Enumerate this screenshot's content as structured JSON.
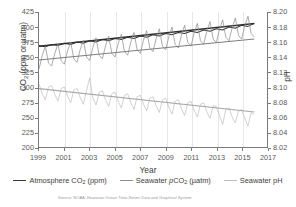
{
  "chart_data": {
    "type": "line",
    "title": "",
    "xlabel": "Year",
    "ylabel": "CO2 (ppm or µatm)",
    "ylabel_right": "pH",
    "xlim": [
      1999,
      2017
    ],
    "ylim": [
      200,
      425
    ],
    "ylim_right": [
      8.02,
      8.2
    ],
    "grid": "vertical-only",
    "legend_position": "bottom-center",
    "source": "Source: NOAA, Hawaiian Ocean Time-Series Data and Graphical System",
    "xticks": [
      "1999",
      "2001",
      "2003",
      "2005",
      "2007",
      "2009",
      "2011",
      "2013",
      "2015",
      "2017"
    ],
    "yticks_left": [
      "200",
      "225",
      "250",
      "275",
      "300",
      "325",
      "350",
      "375",
      "400",
      "425"
    ],
    "yticks_right": [
      "8.02",
      "8.04",
      "8.06",
      "8.08",
      "8.10",
      "8.12",
      "8.14",
      "8.16",
      "8.18",
      "8.20"
    ],
    "colors": {
      "atmosphere": "#3a3a3a",
      "seawater_pco2": "#8f8f8f",
      "seawater_ph": "#bdbdbd",
      "axis": "#7a7a7a",
      "gridline": "#e6e6e6"
    },
    "series": [
      {
        "name": "Atmosphere CO2 (ppm)",
        "axis": "left",
        "units": "ppm",
        "color": "#3a3a3a",
        "trend_start": 368,
        "trend_end": 406,
        "seasonal_amplitude": 3,
        "x": [
          1999.0,
          1999.5,
          2000.0,
          2000.5,
          2001.0,
          2001.5,
          2002.0,
          2002.5,
          2003.0,
          2003.5,
          2004.0,
          2004.5,
          2005.0,
          2005.5,
          2006.0,
          2006.5,
          2007.0,
          2007.5,
          2008.0,
          2008.5,
          2009.0,
          2009.5,
          2010.0,
          2010.5,
          2011.0,
          2011.5,
          2012.0,
          2012.5,
          2013.0,
          2013.5,
          2014.0,
          2014.5,
          2015.0,
          2015.5,
          2016.0
        ],
        "values": [
          369,
          367,
          371,
          369,
          373,
          371,
          375,
          373,
          377,
          375,
          379,
          377,
          381,
          379,
          383,
          381,
          385,
          383,
          387,
          385,
          389,
          387,
          391,
          389,
          393,
          391,
          395,
          393,
          397,
          395,
          400,
          398,
          403,
          401,
          406
        ]
      },
      {
        "name": "Seawater pCO2 (µatm)",
        "axis": "left",
        "units": "µatm",
        "color": "#8f8f8f",
        "trend_start": 345,
        "trend_end": 380,
        "seasonal_amplitude": 22,
        "x": [
          1999.0,
          1999.25,
          1999.5,
          1999.75,
          2000.0,
          2000.25,
          2000.5,
          2000.75,
          2001.0,
          2001.25,
          2001.5,
          2001.75,
          2002.0,
          2002.25,
          2002.5,
          2002.75,
          2003.0,
          2003.25,
          2003.5,
          2003.75,
          2004.0,
          2004.25,
          2004.5,
          2004.75,
          2005.0,
          2005.25,
          2005.5,
          2005.75,
          2006.0,
          2006.25,
          2006.5,
          2006.75,
          2007.0,
          2007.25,
          2007.5,
          2007.75,
          2008.0,
          2008.25,
          2008.5,
          2008.75,
          2009.0,
          2009.25,
          2009.5,
          2009.75,
          2010.0,
          2010.25,
          2010.5,
          2010.75,
          2011.0,
          2011.25,
          2011.5,
          2011.75,
          2012.0,
          2012.25,
          2012.5,
          2012.75,
          2013.0,
          2013.25,
          2013.5,
          2013.75,
          2014.0,
          2014.25,
          2014.5,
          2014.75,
          2015.0,
          2015.25,
          2015.5,
          2015.75,
          2016.0
        ],
        "values": [
          330,
          352,
          368,
          340,
          335,
          356,
          372,
          344,
          338,
          360,
          375,
          347,
          341,
          362,
          378,
          350,
          344,
          366,
          382,
          353,
          347,
          368,
          385,
          356,
          350,
          372,
          388,
          359,
          353,
          375,
          391,
          362,
          356,
          378,
          394,
          365,
          359,
          381,
          397,
          368,
          362,
          384,
          400,
          371,
          365,
          387,
          403,
          374,
          368,
          390,
          406,
          377,
          371,
          393,
          409,
          380,
          374,
          396,
          412,
          383,
          377,
          399,
          415,
          386,
          380,
          402,
          418,
          389,
          383
        ]
      },
      {
        "name": "Seawater pH",
        "axis": "right",
        "units": "pH",
        "color": "#bdbdbd",
        "trend_start": 8.0978,
        "trend_end": 8.0667,
        "seasonal_amplitude": 0.018,
        "x": [
          1999.0,
          1999.25,
          1999.5,
          1999.75,
          2000.0,
          2000.25,
          2000.5,
          2000.75,
          2001.0,
          2001.25,
          2001.5,
          2001.75,
          2002.0,
          2002.25,
          2002.5,
          2002.75,
          2003.0,
          2003.25,
          2003.5,
          2003.75,
          2004.0,
          2004.25,
          2004.5,
          2004.75,
          2005.0,
          2005.25,
          2005.5,
          2005.75,
          2006.0,
          2006.25,
          2006.5,
          2006.75,
          2007.0,
          2007.25,
          2007.5,
          2007.75,
          2008.0,
          2008.25,
          2008.5,
          2008.75,
          2009.0,
          2009.25,
          2009.5,
          2009.75,
          2010.0,
          2010.25,
          2010.5,
          2010.75,
          2011.0,
          2011.25,
          2011.5,
          2011.75,
          2012.0,
          2012.25,
          2012.5,
          2012.75,
          2013.0,
          2013.25,
          2013.5,
          2013.75,
          2014.0,
          2014.25,
          2014.5,
          2014.75,
          2015.0,
          2015.25,
          2015.5,
          2015.75,
          2016.0
        ],
        "values": [
          8.104,
          8.091,
          8.083,
          8.1,
          8.102,
          8.09,
          8.081,
          8.098,
          8.1,
          8.088,
          8.079,
          8.096,
          8.098,
          8.086,
          8.077,
          8.095,
          8.112,
          8.085,
          8.076,
          8.093,
          8.095,
          8.083,
          8.074,
          8.091,
          8.093,
          8.081,
          8.072,
          8.089,
          8.091,
          8.079,
          8.07,
          8.087,
          8.089,
          8.077,
          8.068,
          8.085,
          8.087,
          8.075,
          8.066,
          8.083,
          8.085,
          8.073,
          8.064,
          8.081,
          8.083,
          8.071,
          8.062,
          8.079,
          8.081,
          8.069,
          8.06,
          8.077,
          8.079,
          8.067,
          8.058,
          8.075,
          8.074,
          8.062,
          8.05,
          8.07,
          8.072,
          8.06,
          8.052,
          8.068,
          8.07,
          8.058,
          8.048,
          8.066,
          8.063
        ]
      }
    ]
  },
  "axis_left": {
    "label_pre": "CO",
    "label_sub": "2",
    "label_post": " (ppm or µatm)"
  },
  "axis_right": {
    "label": "pH"
  },
  "axis_x": {
    "label": "Year"
  },
  "legend": {
    "items": [
      {
        "pre": "Atmosphere CO",
        "sub": "2",
        "post": " (ppm)",
        "color": "#3a3a3a",
        "width": "1.7px"
      },
      {
        "pre_italic": "p",
        "pre": "Seawater ",
        "sub": "2",
        "post": " (µatm)",
        "mid": "CO",
        "color": "#8f8f8f",
        "width": "1.3px"
      },
      {
        "pre": "Seawater pH",
        "sub": "",
        "post": "",
        "color": "#bdbdbd",
        "width": "1.1px"
      }
    ],
    "item0_label": "Atmosphere CO2 (ppm)",
    "item1_label": "Seawater pCO2 (µatm)",
    "item2_label": "Seawater pH"
  },
  "footer": {
    "source": "Source: NOAA, Hawaiian Ocean Time-Series Data and Graphical System"
  },
  "title": ""
}
